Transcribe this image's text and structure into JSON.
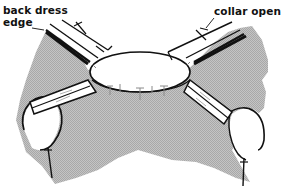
{
  "figure": {
    "colors": {
      "fabric_shade": "#b4b4b4",
      "line": "#111111",
      "background": "#ffffff",
      "stitch_marks": "#8a8a8a"
    }
  },
  "labels": {
    "back_dress_edge_line1": "back dress",
    "back_dress_edge_line2": "edge",
    "collar_open_flat": "collar open flat"
  }
}
